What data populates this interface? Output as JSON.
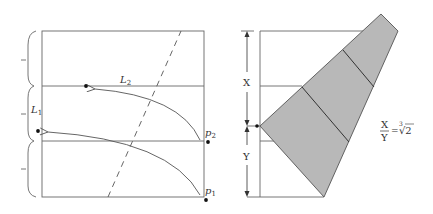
{
  "left_diagram": {
    "labels": {
      "L1": "L",
      "L1_sub": "1",
      "L2": "L",
      "L2_sub": "2",
      "p1": "p",
      "p1_sub": "1",
      "p2": "p",
      "p2_sub": "2"
    },
    "colors": {
      "line": "#555555",
      "dot": "#111111"
    }
  },
  "right_diagram": {
    "labels": {
      "X": "X",
      "Y": "Y",
      "ratio_num": "X",
      "ratio_den": "Y",
      "ratio_eq": "=",
      "ratio_root_index": "3",
      "ratio_root": "√2"
    },
    "colors": {
      "fill": "#b8b8b8",
      "stroke": "#555555"
    }
  }
}
